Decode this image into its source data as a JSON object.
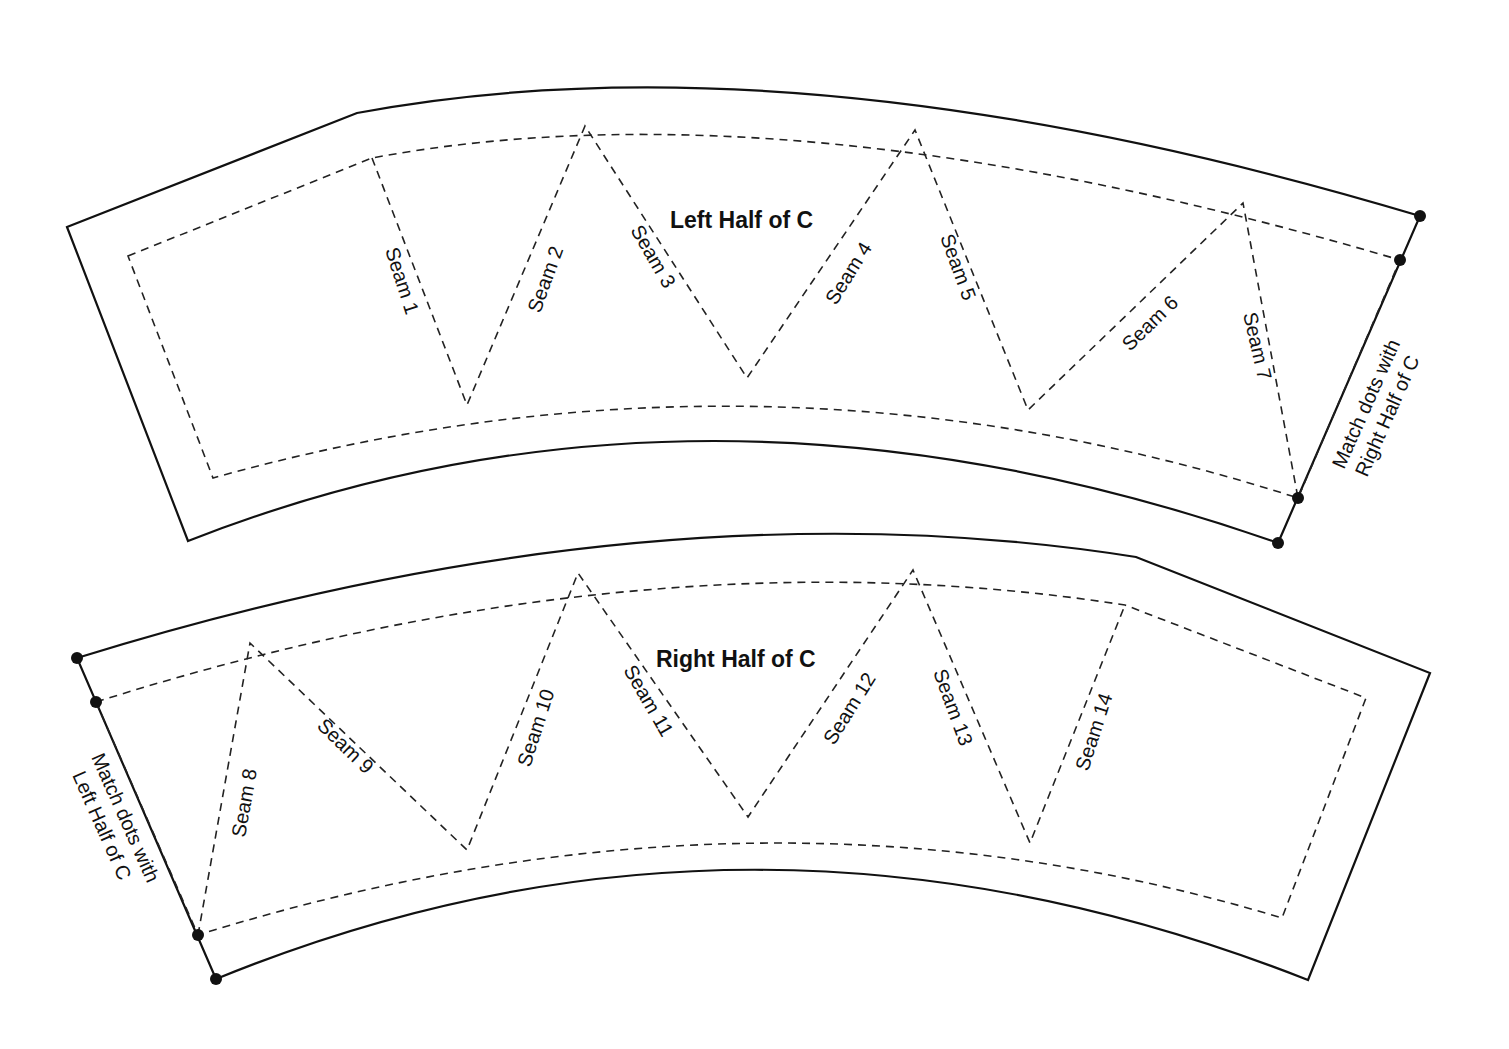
{
  "pieces": {
    "left": {
      "title": "Left Half of C",
      "seams": [
        "Seam 1",
        "Seam 2",
        "Seam 3",
        "Seam 4",
        "Seam 5",
        "Seam 6",
        "Seam 7"
      ],
      "note_line1": "Match dots with",
      "note_line2": "Right Half of C"
    },
    "right": {
      "title": "Right Half of C",
      "seams": [
        "Seam 8",
        "Seam 9",
        "Seam 10",
        "Seam 11",
        "Seam 12",
        "Seam 13",
        "Seam 14"
      ],
      "note_line1": "Match dots with",
      "note_line2": "Left Half of C"
    }
  },
  "colors": {
    "line": "#111111",
    "background": "#ffffff"
  }
}
